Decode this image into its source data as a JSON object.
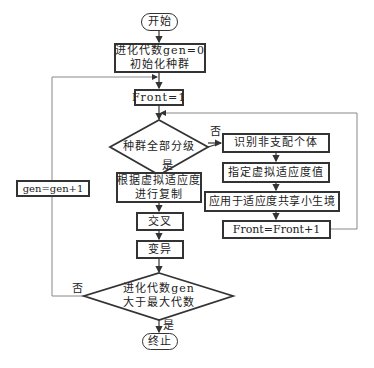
{
  "nodes": {
    "start": "开始",
    "init_line1": "进化代数gen=0",
    "init_line2": "初始化种群",
    "front_init": "Front=1",
    "check_all_ranked": "种群全部分级",
    "identify_nondominated": "识别非支配个体",
    "assign_dummy_fitness": "指定虚拟适应度值",
    "apply_sharing": "应用于适应度共享小生境",
    "front_increment": "Front=Front+1",
    "selection_line1": "根据虚拟适应度",
    "selection_line2": "进行复制",
    "crossover": "交叉",
    "mutation": "变异",
    "check_gen_line1": "进化代数gen",
    "check_gen_line2": "大于最大代数",
    "gen_increment": "gen=gen+1",
    "end": "终止"
  },
  "edge_labels": {
    "ranked_no": "否",
    "ranked_yes": "是",
    "gen_no": "否",
    "gen_yes": "是"
  },
  "colors": {
    "stroke": "#333333",
    "loop_line": "#888888",
    "background": "#ffffff"
  }
}
